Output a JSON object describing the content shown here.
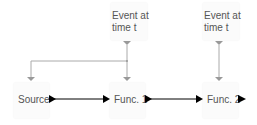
{
  "nodes": {
    "event1": {
      "line1": "Event at",
      "line2": "time t"
    },
    "event2": {
      "line1": "Event at",
      "line2": "time t"
    },
    "source": {
      "label": "Source"
    },
    "func1": {
      "label": "Func. 1"
    },
    "func2": {
      "label": "Func. 2"
    }
  },
  "colors": {
    "arrow_main": "#000000",
    "arrow_event": "#999999",
    "text": "#555555"
  }
}
